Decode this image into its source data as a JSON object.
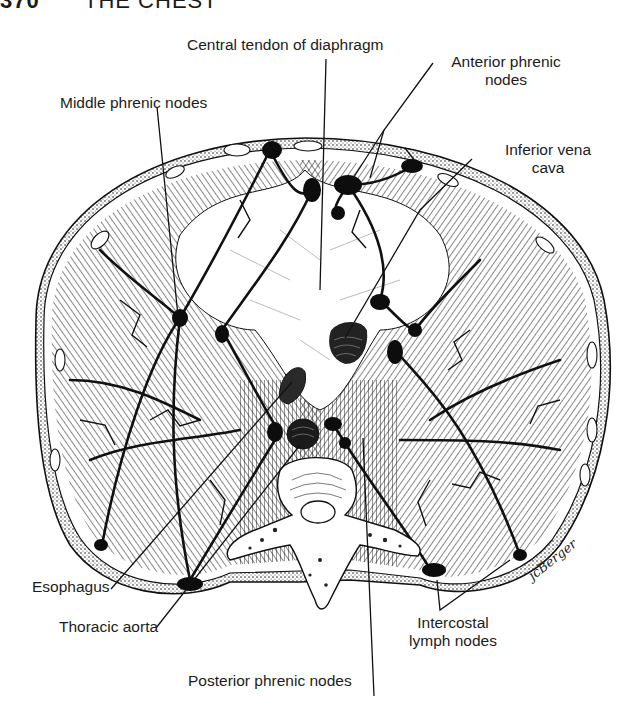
{
  "page": {
    "page_number": "370",
    "running_head": "THE CHEST"
  },
  "figure": {
    "labels": {
      "central_tendon": "Central tendon of diaphragm",
      "anterior_phrenic_line1": "Anterior phrenic",
      "anterior_phrenic_line2": "nodes",
      "middle_phrenic": "Middle phrenic nodes",
      "ivc_line1": "Inferior vena",
      "ivc_line2": "cava",
      "esophagus": "Esophagus",
      "thoracic_aorta": "Thoracic aorta",
      "intercostal_line1": "Intercostal",
      "intercostal_line2": "lymph nodes",
      "posterior_phrenic": "Posterior phrenic nodes"
    },
    "signature": "jcBerger",
    "colors": {
      "ink": "#111111",
      "paper": "#ffffff",
      "label_text": "#1c1c1c"
    }
  }
}
